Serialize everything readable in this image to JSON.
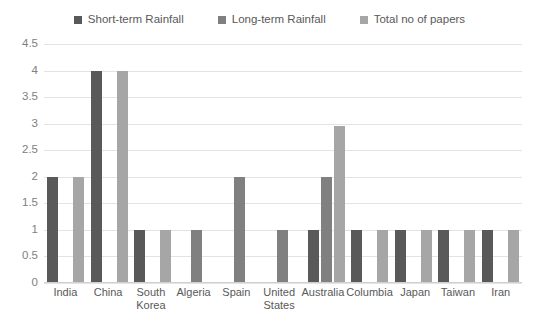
{
  "chart_data": {
    "type": "bar",
    "title": "",
    "subtitle": "",
    "xlabel": "",
    "ylabel": "",
    "ylim": [
      0,
      4.5
    ],
    "ytick_values": [
      0,
      0.5,
      1,
      1.5,
      2,
      2.5,
      3,
      3.5,
      4,
      4.5
    ],
    "ytick_labels": [
      "0",
      "0.5",
      "1",
      "1.5",
      "2",
      "2.5",
      "3",
      "3.5",
      "4",
      "4.5"
    ],
    "grid": true,
    "legend_position": "top-center",
    "categories": [
      "India",
      "China",
      "South Korea",
      "Algeria",
      "Spain",
      "United States",
      "Australia",
      "Columbia",
      "Japan",
      "Taiwan",
      "Iran"
    ],
    "series": [
      {
        "name": "Short-term Rainfall",
        "color": "#595959",
        "values": [
          2,
          4,
          1,
          0,
          0,
          0,
          1,
          1,
          1,
          1,
          1
        ]
      },
      {
        "name": "Long-term Rainfall",
        "color": "#808080",
        "values": [
          0,
          0,
          0,
          1,
          2,
          1,
          2,
          0,
          0,
          0,
          0
        ]
      },
      {
        "name": "Total no of papers",
        "color": "#a6a6a6",
        "values": [
          2,
          4,
          1,
          0,
          0,
          0,
          2.95,
          1,
          1,
          1,
          1
        ]
      }
    ]
  },
  "colors": {
    "series_1": "#595959",
    "series_2": "#808080",
    "series_3": "#a6a6a6",
    "gridline": "#e3e3e3",
    "text": "#595959",
    "axis_text": "#808080",
    "background": "#ffffff"
  }
}
